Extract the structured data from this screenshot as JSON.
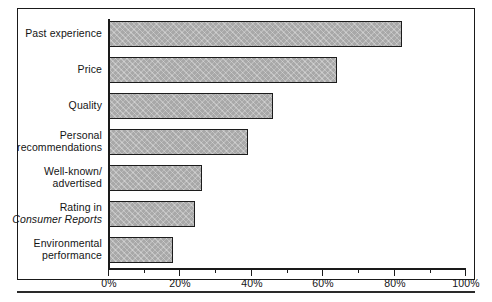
{
  "figure": {
    "frame_color": "#1a1a1a",
    "bar_fill": "#a8a8a8",
    "bar_border": "#1c1c1c"
  },
  "chart_data": {
    "type": "bar",
    "orientation": "horizontal",
    "title": "",
    "subtitle": "",
    "xlabel": "",
    "ylabel": "",
    "grid": false,
    "legend": false,
    "xlim": [
      0,
      100
    ],
    "xtick_major_step": 20,
    "xtick_minor_step": 10,
    "x_tick_labels": [
      "0%",
      "20%",
      "40%",
      "60%",
      "80%",
      "100%"
    ],
    "x_tick_values": [
      0,
      20,
      40,
      60,
      80,
      100
    ],
    "categories": [
      "Past experience",
      "Price",
      "Quality",
      "Personal recommendations",
      "Well-known/ advertised",
      "Rating in Consumer Reports",
      "Environmental performance"
    ],
    "values": [
      82,
      64,
      46,
      39,
      26,
      24,
      18
    ],
    "value_unit": "%"
  },
  "labels": [
    {
      "line1": "Past experience",
      "line2": "",
      "italic_line": 0
    },
    {
      "line1": "Price",
      "line2": "",
      "italic_line": 0
    },
    {
      "line1": "Quality",
      "line2": "",
      "italic_line": 0
    },
    {
      "line1": "Personal",
      "line2": "recommendations",
      "italic_line": 0
    },
    {
      "line1": "Well-known/",
      "line2": "advertised",
      "italic_line": 0
    },
    {
      "line1": "Rating in",
      "line2": "Consumer Reports",
      "italic_line": 2
    },
    {
      "line1": "Environmental",
      "line2": "performance",
      "italic_line": 0
    }
  ]
}
